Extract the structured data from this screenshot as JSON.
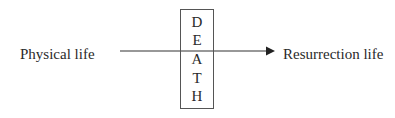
{
  "diagram": {
    "left_label": "Physical life",
    "right_label": "Resurrection life",
    "box_letters": [
      "D",
      "E",
      "A",
      "T",
      "H"
    ],
    "box_word": "DEATH",
    "arrow": {
      "direction": "right",
      "from": "Physical life",
      "to": "Resurrection life",
      "crosses": "DEATH"
    },
    "colors": {
      "line": "#333333",
      "text": "#2a2a2a",
      "background": "#ffffff"
    }
  }
}
